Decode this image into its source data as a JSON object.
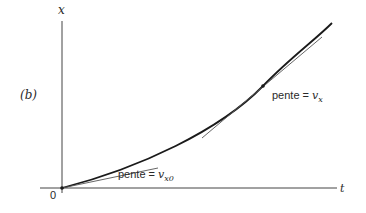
{
  "figure": {
    "panel_label": "(b)",
    "axes": {
      "vertical_label": "x",
      "horizontal_label": "t",
      "origin_label": "0"
    },
    "annotations": {
      "slope_at_point": {
        "prefix": "pente = ",
        "symbol": "v",
        "subscript": "x"
      },
      "slope_at_origin": {
        "prefix": "pente = ",
        "symbol": "v",
        "subscript": "x0"
      }
    },
    "colors": {
      "curve": "#1a1a1a",
      "axis": "#444444",
      "tangent": "#555555",
      "text": "#2a2a2a"
    }
  }
}
